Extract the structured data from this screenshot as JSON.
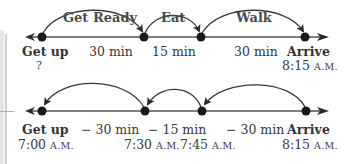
{
  "top_line": {
    "arcs": [
      {
        "label": "Get Ready"
      },
      {
        "label": "Eat"
      },
      {
        "label": "Walk"
      }
    ],
    "points": [
      {
        "name": "Get up",
        "time": "?"
      },
      {
        "name": "",
        "time": ""
      },
      {
        "name": "",
        "time": ""
      },
      {
        "name": "Arrive",
        "time_num": "8:15",
        "time_suffix": "A.M."
      }
    ],
    "intervals": [
      "30 min",
      "15 min",
      "30 min"
    ]
  },
  "bottom_line": {
    "points": [
      {
        "name": "Get up",
        "time_num": "7:00",
        "time_suffix": "A.M."
      },
      {
        "name": "",
        "time_num": "7:30",
        "time_suffix": "A.M."
      },
      {
        "name": "",
        "time_num": "7:45",
        "time_suffix": "A.M."
      },
      {
        "name": "Arrive",
        "time_num": "8:15",
        "time_suffix": "A.M."
      }
    ],
    "intervals": [
      "− 30 min",
      "− 15 min",
      "− 30 min"
    ]
  },
  "colors": {
    "line": "#555555",
    "dot": "#1a1a1a",
    "arc": "#3a3a3a"
  }
}
